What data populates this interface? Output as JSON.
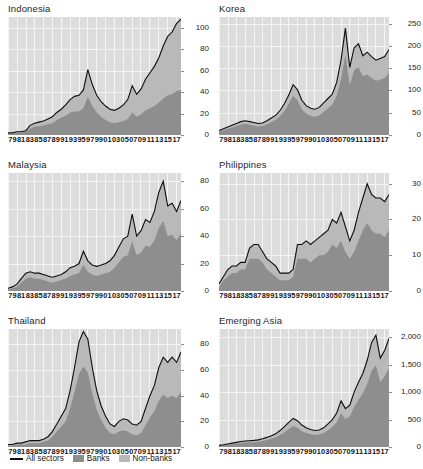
{
  "figure": {
    "panel_layout": "3 rows x 2 columns",
    "x_tick_labels": [
      "79",
      "81",
      "83",
      "85",
      "87",
      "89",
      "91",
      "93",
      "95",
      "97",
      "99",
      "01",
      "03",
      "05",
      "07",
      "09",
      "11",
      "13",
      "15",
      "17"
    ],
    "legend": [
      {
        "key": "all-sectors",
        "label": "All sectors",
        "marker": "line",
        "color": "#0d0d0d"
      },
      {
        "key": "banks",
        "label": "Banks",
        "marker": "swatch",
        "color": "#8e8e8e"
      },
      {
        "key": "non-banks",
        "label": "Non-banks",
        "marker": "swatch",
        "color": "#b9b9b9"
      }
    ],
    "colors": {
      "plot_background": "#dcdcdc",
      "gridline": "#f4f4f4",
      "banks_fill": "#8e8e8e",
      "non_banks_fill": "#b9b9b9",
      "all_sectors_line": "#0d0d0d",
      "page_background": "#ffffff",
      "text": "#1c1c1c"
    }
  },
  "chart_data": [
    {
      "type": "area",
      "title": "Indonesia",
      "xlabel": "",
      "ylabel": "",
      "ylim": [
        0,
        110
      ],
      "y_ticks": [
        0,
        20,
        40,
        60,
        80,
        100
      ],
      "y_tick_labels": [
        "0",
        "20",
        "40",
        "60",
        "80",
        "100"
      ],
      "grid": true,
      "legend_position": "figure-bottom-left",
      "x": [
        1979,
        1980,
        1981,
        1982,
        1983,
        1984,
        1985,
        1986,
        1987,
        1988,
        1989,
        1990,
        1991,
        1992,
        1993,
        1994,
        1995,
        1996,
        1997,
        1998,
        1999,
        2000,
        2001,
        2002,
        2003,
        2004,
        2005,
        2006,
        2007,
        2008,
        2009,
        2010,
        2011,
        2012,
        2013,
        2014,
        2015,
        2016,
        2017,
        2018
      ],
      "series": [
        {
          "name": "All sectors",
          "values": [
            2,
            2,
            3,
            3,
            4,
            9,
            11,
            12,
            13,
            15,
            17,
            21,
            24,
            28,
            33,
            36,
            37,
            42,
            61,
            47,
            37,
            31,
            27,
            24,
            23,
            25,
            28,
            33,
            46,
            38,
            43,
            52,
            58,
            64,
            72,
            83,
            92,
            96,
            104,
            108
          ]
        },
        {
          "name": "Banks",
          "values": [
            1,
            1,
            2,
            2,
            3,
            6,
            8,
            8,
            9,
            10,
            11,
            14,
            16,
            18,
            21,
            22,
            22,
            25,
            36,
            27,
            21,
            17,
            14,
            12,
            11,
            12,
            13,
            15,
            21,
            17,
            19,
            23,
            25,
            27,
            30,
            34,
            37,
            38,
            41,
            42
          ]
        },
        {
          "name": "Non-banks",
          "values": [
            1,
            1,
            1,
            1,
            1,
            3,
            3,
            4,
            4,
            5,
            6,
            7,
            8,
            10,
            12,
            14,
            15,
            17,
            25,
            20,
            16,
            14,
            13,
            12,
            12,
            13,
            15,
            18,
            25,
            21,
            24,
            29,
            33,
            37,
            42,
            49,
            55,
            58,
            63,
            66
          ]
        }
      ]
    },
    {
      "type": "area",
      "title": "Korea",
      "xlabel": "",
      "ylabel": "",
      "ylim": [
        0,
        265
      ],
      "y_ticks": [
        0,
        50,
        100,
        150,
        200,
        250
      ],
      "y_tick_labels": [
        "0",
        "50",
        "100",
        "150",
        "200",
        "250"
      ],
      "grid": true,
      "x": [
        1979,
        1980,
        1981,
        1982,
        1983,
        1984,
        1985,
        1986,
        1987,
        1988,
        1989,
        1990,
        1991,
        1992,
        1993,
        1994,
        1995,
        1996,
        1997,
        1998,
        1999,
        2000,
        2001,
        2002,
        2003,
        2004,
        2005,
        2006,
        2007,
        2008,
        2009,
        2010,
        2011,
        2012,
        2013,
        2014,
        2015,
        2016,
        2017,
        2018
      ],
      "series": [
        {
          "name": "All sectors",
          "values": [
            10,
            14,
            18,
            22,
            26,
            30,
            32,
            30,
            28,
            26,
            27,
            32,
            38,
            44,
            55,
            70,
            90,
            113,
            102,
            78,
            66,
            60,
            58,
            62,
            72,
            82,
            92,
            118,
            168,
            240,
            152,
            196,
            205,
            178,
            186,
            176,
            168,
            172,
            176,
            192
          ]
        },
        {
          "name": "Banks",
          "values": [
            8,
            11,
            14,
            17,
            20,
            23,
            25,
            23,
            21,
            19,
            20,
            24,
            29,
            34,
            42,
            54,
            70,
            88,
            78,
            58,
            48,
            43,
            41,
            44,
            52,
            60,
            68,
            88,
            126,
            180,
            112,
            146,
            152,
            132,
            136,
            128,
            122,
            124,
            128,
            140
          ]
        },
        {
          "name": "Non-banks",
          "values": [
            2,
            3,
            4,
            5,
            6,
            7,
            7,
            7,
            7,
            7,
            7,
            8,
            9,
            10,
            13,
            16,
            20,
            25,
            24,
            20,
            18,
            17,
            17,
            18,
            20,
            22,
            24,
            30,
            42,
            60,
            40,
            50,
            53,
            46,
            50,
            48,
            46,
            48,
            48,
            52
          ]
        }
      ]
    },
    {
      "type": "area",
      "title": "Malaysia",
      "xlabel": "",
      "ylabel": "",
      "ylim": [
        0,
        86
      ],
      "y_ticks": [
        0,
        20,
        40,
        60,
        80
      ],
      "y_tick_labels": [
        "0",
        "20",
        "40",
        "60",
        "80"
      ],
      "grid": true,
      "x": [
        1979,
        1980,
        1981,
        1982,
        1983,
        1984,
        1985,
        1986,
        1987,
        1988,
        1989,
        1990,
        1991,
        1992,
        1993,
        1994,
        1995,
        1996,
        1997,
        1998,
        1999,
        2000,
        2001,
        2002,
        2003,
        2004,
        2005,
        2006,
        2007,
        2008,
        2009,
        2010,
        2011,
        2012,
        2013,
        2014,
        2015,
        2016,
        2017,
        2018
      ],
      "series": [
        {
          "name": "All sectors",
          "values": [
            2,
            3,
            5,
            9,
            13,
            14,
            13,
            13,
            12,
            11,
            10,
            11,
            12,
            14,
            17,
            18,
            20,
            29,
            22,
            19,
            18,
            19,
            20,
            22,
            26,
            32,
            38,
            40,
            56,
            40,
            44,
            52,
            50,
            58,
            72,
            80,
            62,
            64,
            58,
            66
          ]
        },
        {
          "name": "Banks",
          "values": [
            1,
            2,
            3,
            6,
            9,
            10,
            9,
            9,
            8,
            7,
            6,
            7,
            8,
            9,
            11,
            12,
            13,
            19,
            14,
            12,
            11,
            12,
            13,
            14,
            17,
            21,
            25,
            26,
            36,
            26,
            28,
            33,
            32,
            37,
            46,
            51,
            40,
            41,
            37,
            42
          ]
        },
        {
          "name": "Non-banks",
          "values": [
            1,
            1,
            2,
            3,
            4,
            4,
            4,
            4,
            4,
            4,
            4,
            4,
            4,
            5,
            6,
            6,
            7,
            10,
            8,
            7,
            7,
            7,
            7,
            8,
            9,
            11,
            13,
            14,
            20,
            14,
            16,
            19,
            18,
            21,
            26,
            29,
            22,
            23,
            21,
            24
          ]
        }
      ]
    },
    {
      "type": "area",
      "title": "Philippines",
      "xlabel": "",
      "ylabel": "",
      "ylim": [
        0,
        33
      ],
      "y_ticks": [
        0,
        10,
        20,
        30
      ],
      "y_tick_labels": [
        "0",
        "10",
        "20",
        "30"
      ],
      "grid": true,
      "x": [
        1979,
        1980,
        1981,
        1982,
        1983,
        1984,
        1985,
        1986,
        1987,
        1988,
        1989,
        1990,
        1991,
        1992,
        1993,
        1994,
        1995,
        1996,
        1997,
        1998,
        1999,
        2000,
        2001,
        2002,
        2003,
        2004,
        2005,
        2006,
        2007,
        2008,
        2009,
        2010,
        2011,
        2012,
        2013,
        2014,
        2015,
        2016,
        2017,
        2018
      ],
      "series": [
        {
          "name": "All sectors",
          "values": [
            2,
            4,
            6,
            7,
            7,
            8,
            8,
            12,
            13,
            13,
            11,
            9,
            8,
            7,
            5,
            5,
            5,
            6,
            13,
            13,
            14,
            13,
            14,
            15,
            16,
            17,
            20,
            19,
            22,
            18,
            14,
            17,
            22,
            26,
            30,
            27,
            26,
            26,
            25,
            27
          ]
        },
        {
          "name": "Banks",
          "values": [
            1,
            3,
            4,
            5,
            5,
            6,
            6,
            9,
            9,
            9,
            8,
            6,
            5,
            4,
            3,
            3,
            3,
            4,
            9,
            9,
            9,
            8,
            9,
            10,
            10,
            11,
            13,
            12,
            14,
            11,
            9,
            11,
            14,
            17,
            19,
            17,
            16,
            16,
            15,
            17
          ]
        },
        {
          "name": "Non-banks",
          "values": [
            1,
            1,
            2,
            2,
            2,
            2,
            2,
            3,
            4,
            4,
            3,
            3,
            3,
            3,
            2,
            2,
            2,
            2,
            4,
            4,
            5,
            5,
            5,
            5,
            6,
            6,
            7,
            7,
            8,
            7,
            5,
            6,
            8,
            9,
            11,
            10,
            10,
            10,
            10,
            10
          ]
        }
      ]
    },
    {
      "type": "area",
      "title": "Thailand",
      "xlabel": "",
      "ylabel": "",
      "ylim": [
        0,
        92
      ],
      "y_ticks": [
        0,
        20,
        40,
        60,
        80
      ],
      "y_tick_labels": [
        "0",
        "20",
        "40",
        "60",
        "80"
      ],
      "grid": true,
      "x": [
        1979,
        1980,
        1981,
        1982,
        1983,
        1984,
        1985,
        1986,
        1987,
        1988,
        1989,
        1990,
        1991,
        1992,
        1993,
        1994,
        1995,
        1996,
        1997,
        1998,
        1999,
        2000,
        2001,
        2002,
        2003,
        2004,
        2005,
        2006,
        2007,
        2008,
        2009,
        2010,
        2011,
        2012,
        2013,
        2014,
        2015,
        2016,
        2017,
        2018
      ],
      "series": [
        {
          "name": "All sectors",
          "values": [
            2,
            2,
            3,
            3,
            4,
            5,
            5,
            5,
            6,
            8,
            12,
            18,
            24,
            30,
            44,
            62,
            82,
            90,
            84,
            62,
            44,
            32,
            24,
            18,
            16,
            20,
            22,
            21,
            18,
            17,
            20,
            30,
            40,
            48,
            62,
            70,
            66,
            70,
            66,
            74
          ]
        },
        {
          "name": "Banks",
          "values": [
            1,
            1,
            2,
            2,
            2,
            3,
            3,
            3,
            4,
            5,
            8,
            12,
            16,
            20,
            30,
            43,
            57,
            63,
            58,
            42,
            29,
            21,
            15,
            11,
            10,
            12,
            13,
            12,
            10,
            9,
            11,
            17,
            23,
            28,
            36,
            41,
            38,
            40,
            38,
            43
          ]
        },
        {
          "name": "Non-banks",
          "values": [
            1,
            1,
            1,
            1,
            2,
            2,
            2,
            2,
            2,
            3,
            4,
            6,
            8,
            10,
            14,
            19,
            25,
            27,
            26,
            20,
            15,
            11,
            9,
            7,
            6,
            8,
            9,
            9,
            8,
            8,
            9,
            13,
            17,
            20,
            26,
            29,
            28,
            30,
            28,
            31
          ]
        }
      ]
    },
    {
      "type": "area",
      "title": "Emerging Asia",
      "xlabel": "",
      "ylabel": "",
      "ylim": [
        0,
        2150
      ],
      "y_ticks": [
        0,
        500,
        1000,
        1500,
        2000
      ],
      "y_tick_labels": [
        "0",
        "500",
        "1,000",
        "1,500",
        "2,000"
      ],
      "grid": true,
      "x": [
        1979,
        1980,
        1981,
        1982,
        1983,
        1984,
        1985,
        1986,
        1987,
        1988,
        1989,
        1990,
        1991,
        1992,
        1993,
        1994,
        1995,
        1996,
        1997,
        1998,
        1999,
        2000,
        2001,
        2002,
        2003,
        2004,
        2005,
        2006,
        2007,
        2008,
        2009,
        2010,
        2011,
        2012,
        2013,
        2014,
        2015,
        2016,
        2017,
        2018
      ],
      "series": [
        {
          "name": "All sectors",
          "values": [
            30,
            40,
            55,
            70,
            85,
            100,
            110,
            115,
            120,
            130,
            150,
            175,
            205,
            240,
            300,
            370,
            450,
            520,
            480,
            400,
            350,
            320,
            300,
            310,
            350,
            420,
            500,
            620,
            840,
            700,
            760,
            1000,
            1180,
            1340,
            1580,
            1900,
            2040,
            1620,
            1760,
            1980
          ]
        },
        {
          "name": "Banks",
          "values": [
            22,
            30,
            41,
            52,
            63,
            74,
            81,
            85,
            88,
            95,
            110,
            128,
            150,
            176,
            220,
            271,
            330,
            381,
            351,
            292,
            255,
            233,
            219,
            226,
            255,
            306,
            365,
            452,
            613,
            511,
            554,
            730,
            861,
            978,
            1153,
            1386,
            1488,
            1182,
            1284,
            1444
          ]
        },
        {
          "name": "Non-banks",
          "values": [
            8,
            10,
            14,
            18,
            22,
            26,
            29,
            30,
            32,
            35,
            40,
            47,
            55,
            64,
            80,
            99,
            120,
            139,
            129,
            108,
            95,
            87,
            81,
            84,
            95,
            114,
            135,
            168,
            227,
            189,
            206,
            270,
            319,
            362,
            427,
            514,
            552,
            438,
            476,
            536
          ]
        }
      ]
    }
  ]
}
